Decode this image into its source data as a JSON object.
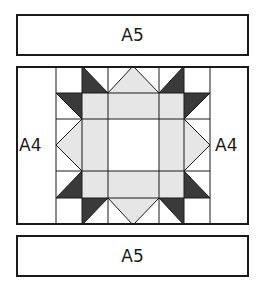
{
  "diagram": {
    "top_panel": {
      "label": "A5"
    },
    "bottom_panel": {
      "label": "A5"
    },
    "left_strip": {
      "label": "A4"
    },
    "right_strip": {
      "label": "A4"
    },
    "block": {
      "grid": {
        "columns": 6,
        "rows": 6
      },
      "colors": {
        "outline": "#1a1a1a",
        "light_fill": "#e6e6e6",
        "dark_fill": "#3a3a3a",
        "background": "#ffffff"
      }
    }
  }
}
